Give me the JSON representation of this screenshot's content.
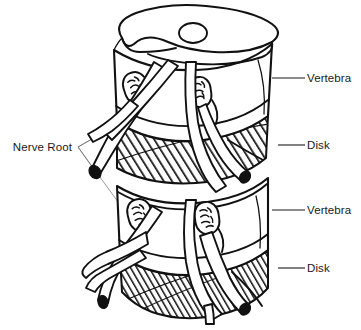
{
  "figure": {
    "background_color": "#ffffff",
    "ink_color": "#111111",
    "label_color": "#1a1a1a"
  },
  "labels": {
    "left": [
      {
        "id": "nerve-root",
        "text": "Nerve Root",
        "text_x": 72,
        "text_y": 151,
        "hub_x": 78,
        "hub_y": 147,
        "leaders": [
          {
            "x": 168,
            "y": 96
          },
          {
            "x": 128,
            "y": 118
          },
          {
            "x": 100,
            "y": 178
          },
          {
            "x": 140,
            "y": 232
          }
        ]
      }
    ],
    "right": [
      {
        "id": "vertebra-upper",
        "text": "Vertebra",
        "text_x": 307,
        "text_y": 82,
        "line_x1": 272,
        "line_x2": 305,
        "line_y": 78
      },
      {
        "id": "disk-upper",
        "text": "Disk",
        "text_x": 307,
        "text_y": 149,
        "line_x1": 278,
        "line_x2": 305,
        "line_y": 145
      },
      {
        "id": "vertebra-lower",
        "text": "Vertebra",
        "text_x": 307,
        "text_y": 214,
        "line_x1": 272,
        "line_x2": 305,
        "line_y": 210
      },
      {
        "id": "disk-lower",
        "text": "Disk",
        "text_x": 307,
        "text_y": 272,
        "line_x1": 278,
        "line_x2": 305,
        "line_y": 268
      }
    ]
  },
  "anatomy": {
    "endplate": {
      "name": "superior-vertebral-endplate",
      "foramen_center_x": 193,
      "foramen_center_y": 33,
      "foramen_rx": 14,
      "foramen_ry": 10
    },
    "vertebrae": [
      {
        "name": "upper-vertebral-body",
        "top_y": 48,
        "bottom_y": 118
      },
      {
        "name": "lower-vertebral-body",
        "top_y": 182,
        "bottom_y": 252
      }
    ],
    "disks": [
      {
        "name": "upper-intervertebral-disk",
        "top_y": 118,
        "bottom_y": 182,
        "hatch": "diagonal"
      },
      {
        "name": "lower-intervertebral-disk",
        "top_y": 252,
        "bottom_y": 318,
        "hatch": "diagonal"
      }
    ],
    "foramina": [
      {
        "name": "foramen-upper-left",
        "cx": 136,
        "cy": 88,
        "rx": 12,
        "ry": 16,
        "rot": -18
      },
      {
        "name": "foramen-upper-right",
        "cx": 200,
        "cy": 92,
        "rx": 11,
        "ry": 15,
        "rot": -8
      },
      {
        "name": "foramen-lower-left",
        "cx": 140,
        "cy": 215,
        "rx": 12,
        "ry": 16,
        "rot": -14
      },
      {
        "name": "foramen-lower-right",
        "cx": 207,
        "cy": 218,
        "rx": 12,
        "ry": 16,
        "rot": -8
      }
    ],
    "nerve_root_count": 10
  }
}
